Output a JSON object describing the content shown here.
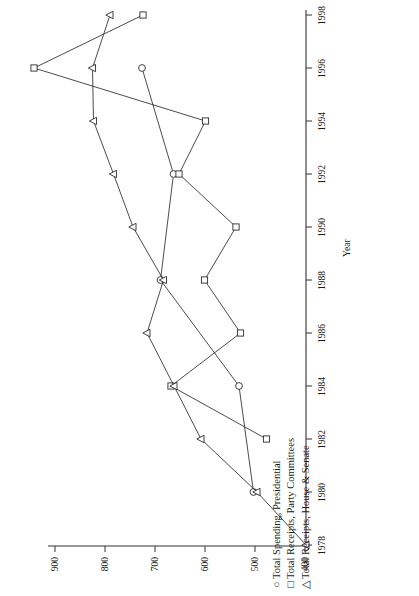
{
  "chart_data": {
    "type": "line",
    "title": "",
    "subtitle": "",
    "orientation": "rotated-90",
    "xlabel": "Year",
    "ylabel": "",
    "x": [
      1978,
      1980,
      1982,
      1984,
      1986,
      1988,
      1990,
      1992,
      1994,
      1996,
      1998
    ],
    "xtick_labels": [
      "1978",
      "1980",
      "1982",
      "1984",
      "1986",
      "1988",
      "1990",
      "1992",
      "1994",
      "1996",
      "1998"
    ],
    "xlim": [
      1977,
      1999
    ],
    "ylim": [
      380,
      950
    ],
    "ytick_labels": [
      "900",
      "800",
      "700",
      "600",
      "500",
      "400"
    ],
    "yticks": [
      900,
      800,
      700,
      600,
      500,
      400
    ],
    "grid": false,
    "legend_position": "bottom-right",
    "series": [
      {
        "name": "Total Spending, Presidential",
        "marker": "circle",
        "glyph": "○",
        "x": [
          1980,
          1984,
          1988,
          1992,
          1996
        ],
        "values": [
          503,
          532,
          689,
          663,
          726
        ]
      },
      {
        "name": "Total Receipts, Party Committees",
        "marker": "square",
        "glyph": "□",
        "x": [
          1982,
          1984,
          1986,
          1988,
          1990,
          1992,
          1994,
          1996,
          1998
        ],
        "values": [
          477,
          668,
          529,
          601,
          538,
          652,
          599,
          942,
          724
        ]
      },
      {
        "name": "Total Receipts, House & Senate",
        "marker": "triangle",
        "glyph": "△",
        "x": [
          1978,
          1980,
          1982,
          1984,
          1986,
          1988,
          1990,
          1992,
          1994,
          1996,
          1998
        ],
        "values": [
          398,
          496,
          608,
          662,
          716,
          683,
          744,
          783,
          823,
          825,
          790
        ]
      }
    ]
  },
  "axes": {
    "x_axis_title": "Year"
  },
  "legend": {
    "entries": [
      {
        "glyph": "○",
        "label": "Total Spending, Presidential"
      },
      {
        "glyph": "□",
        "label": "Total Receipts, Party Committees"
      },
      {
        "glyph": "△",
        "label": "Total Receipts, House & Senate"
      }
    ]
  }
}
